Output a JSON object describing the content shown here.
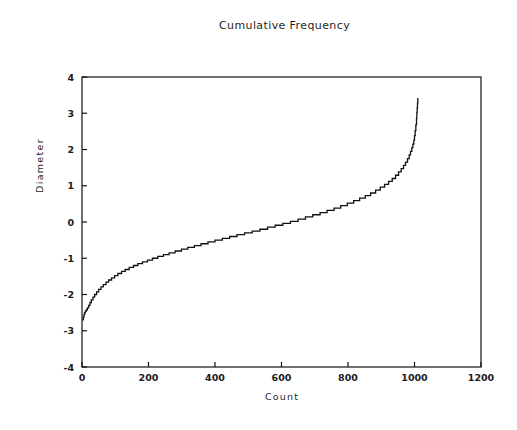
{
  "chart_data": {
    "type": "line",
    "title": "Cumulative Frequency",
    "xlabel": "Count",
    "ylabel": "Diameter",
    "xlim": [
      0,
      1200
    ],
    "ylim": [
      -4,
      4
    ],
    "xticks": [
      0,
      200,
      400,
      600,
      800,
      1000,
      1200
    ],
    "xtick_labels": [
      "0",
      "200",
      "400",
      "600",
      "800",
      "1000",
      "1200"
    ],
    "yticks": [
      -4,
      -3,
      -2,
      -1,
      0,
      1,
      2,
      3,
      4
    ],
    "ytick_labels": [
      "-4",
      "-3",
      "-2",
      "-1",
      "0",
      "1",
      "2",
      "3",
      "4"
    ],
    "grid": false,
    "legend": null,
    "line_color": "#111111",
    "line_width": 1.3,
    "step_style": "staircase",
    "series": [
      {
        "name": "Cumulative diameter quantiles",
        "x": [
          2,
          4,
          6,
          8,
          10,
          13,
          16,
          20,
          24,
          28,
          33,
          38,
          44,
          50,
          57,
          64,
          72,
          80,
          89,
          98,
          108,
          119,
          130,
          142,
          155,
          168,
          182,
          197,
          212,
          228,
          245,
          262,
          280,
          299,
          318,
          338,
          358,
          379,
          400,
          422,
          444,
          466,
          489,
          512,
          535,
          558,
          581,
          604,
          627,
          650,
          672,
          694,
          716,
          737,
          758,
          778,
          798,
          817,
          835,
          852,
          868,
          883,
          897,
          910,
          922,
          933,
          943,
          952,
          960,
          967,
          973,
          979,
          984,
          988,
          992,
          995,
          998,
          1000,
          1002,
          1004,
          1006,
          1007,
          1008,
          1009,
          1010
        ],
        "y": [
          -2.7,
          -2.62,
          -2.55,
          -2.5,
          -2.46,
          -2.42,
          -2.37,
          -2.3,
          -2.22,
          -2.15,
          -2.07,
          -2.0,
          -1.93,
          -1.86,
          -1.79,
          -1.73,
          -1.66,
          -1.6,
          -1.54,
          -1.48,
          -1.42,
          -1.36,
          -1.31,
          -1.25,
          -1.2,
          -1.15,
          -1.1,
          -1.05,
          -1.0,
          -0.95,
          -0.9,
          -0.85,
          -0.8,
          -0.75,
          -0.7,
          -0.65,
          -0.6,
          -0.55,
          -0.5,
          -0.45,
          -0.4,
          -0.35,
          -0.3,
          -0.25,
          -0.2,
          -0.14,
          -0.09,
          -0.04,
          0.02,
          0.08,
          0.14,
          0.2,
          0.26,
          0.32,
          0.38,
          0.45,
          0.52,
          0.59,
          0.66,
          0.73,
          0.8,
          0.88,
          0.96,
          1.04,
          1.12,
          1.2,
          1.29,
          1.38,
          1.47,
          1.56,
          1.65,
          1.75,
          1.85,
          1.95,
          2.05,
          2.15,
          2.26,
          2.38,
          2.52,
          2.68,
          2.86,
          3.02,
          3.15,
          3.28,
          3.42
        ]
      }
    ]
  }
}
